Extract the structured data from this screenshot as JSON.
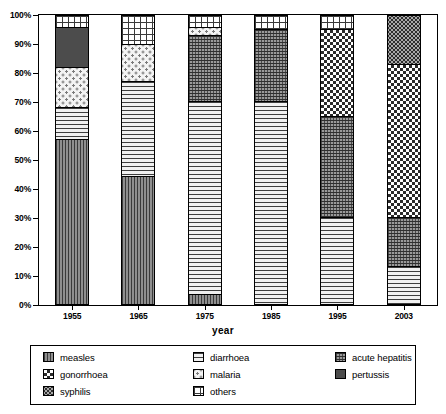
{
  "chart_data": {
    "type": "bar",
    "subtype": "100% stacked column",
    "title": "",
    "xlabel": "year",
    "ylabel": "",
    "ylim": [
      0,
      100
    ],
    "grid": false,
    "legend_position": "bottom",
    "categories": [
      "1955",
      "1965",
      "1975",
      "1985",
      "1995",
      "2003"
    ],
    "y_ticks": [
      "0%",
      "10%",
      "20%",
      "30%",
      "40%",
      "50%",
      "60%",
      "70%",
      "80%",
      "90%",
      "100%"
    ],
    "y_tick_values": [
      0,
      10,
      20,
      30,
      40,
      50,
      60,
      70,
      80,
      90,
      100
    ],
    "stack_order_bottom_to_top": [
      "measles",
      "diarrhoea",
      "acute hepatitis",
      "gonorrhoea",
      "syphilis",
      "malaria",
      "pertussis",
      "others"
    ],
    "series": [
      {
        "name": "measles",
        "pattern": "vertical-lines-dark",
        "values": [
          57,
          44,
          3,
          0,
          0,
          0
        ]
      },
      {
        "name": "diarrhoea",
        "pattern": "horizontal-lines",
        "values": [
          11,
          33,
          67,
          70,
          30,
          13
        ]
      },
      {
        "name": "acute hepatitis",
        "pattern": "dense-crosshatch",
        "values": [
          0,
          0,
          23,
          25,
          35,
          17
        ]
      },
      {
        "name": "gonorrhoea",
        "pattern": "checkerboard",
        "values": [
          0,
          0,
          0,
          0,
          30,
          53
        ]
      },
      {
        "name": "syphilis",
        "pattern": "fine-stipple",
        "values": [
          0,
          0,
          0,
          0,
          0,
          17
        ]
      },
      {
        "name": "malaria",
        "pattern": "sparse-dots-light",
        "values": [
          14,
          13,
          3,
          0,
          0,
          0
        ]
      },
      {
        "name": "pertussis",
        "pattern": "solid-dark-gray",
        "values": [
          14,
          0,
          0,
          0,
          0,
          0
        ]
      },
      {
        "name": "others",
        "pattern": "open-grid",
        "values": [
          4,
          10,
          4,
          5,
          5,
          0
        ]
      }
    ],
    "cumulative_boundaries": {
      "1955": [
        0,
        57,
        68,
        68,
        68,
        68,
        82,
        96,
        100
      ],
      "1965": [
        0,
        44,
        77,
        77,
        77,
        77,
        90,
        90,
        100
      ],
      "1975": [
        0,
        3,
        70,
        93,
        93,
        93,
        96,
        96,
        100
      ],
      "1985": [
        0,
        0,
        70,
        95,
        95,
        95,
        95,
        95,
        100
      ],
      "1995": [
        0,
        0,
        30,
        65,
        95,
        95,
        95,
        95,
        100
      ],
      "2003": [
        0,
        0,
        13,
        30,
        83,
        100,
        100,
        100,
        100
      ]
    }
  },
  "axes": {
    "x_title": "year",
    "x_tick_labels": [
      "1955",
      "1965",
      "1975",
      "1985",
      "1995",
      "2003"
    ],
    "y_tick_labels": [
      "100%",
      "90%",
      "80%",
      "70%",
      "60%",
      "50%",
      "40%",
      "30%",
      "20%",
      "10%",
      "0%"
    ]
  },
  "legend": {
    "columns": [
      {
        "items": [
          {
            "label": "measles",
            "pattern": "measles"
          },
          {
            "label": "gonorrhoea",
            "pattern": "gonorrhoea"
          },
          {
            "label": "syphilis",
            "pattern": "syphilis"
          }
        ]
      },
      {
        "items": [
          {
            "label": "diarrhoea",
            "pattern": "diarrhoea"
          },
          {
            "label": "malaria",
            "pattern": "malaria"
          },
          {
            "label": "others",
            "pattern": "others"
          }
        ]
      },
      {
        "items": [
          {
            "label": "acute hepatitis",
            "pattern": "acute-hepatitis"
          },
          {
            "label": "pertussis",
            "pattern": "pertussis"
          }
        ]
      }
    ]
  },
  "colors": {
    "background": "#ffffff",
    "axis": "#000000",
    "text": "#000000",
    "measles": "#6e6e6e",
    "diarrhoea": "#d8d8d8",
    "acute_hepatitis": "#9a9a9a",
    "gonorrhoea": "#2b2b2b",
    "syphilis": "#a9a9a9",
    "malaria": "#f3f3f3",
    "pertussis": "#4c4c4c",
    "others": "#ffffff"
  }
}
